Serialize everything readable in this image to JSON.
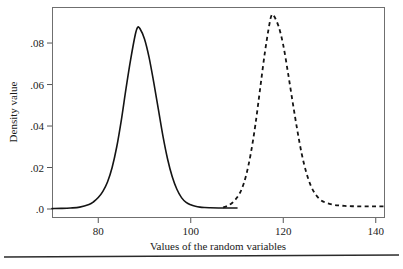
{
  "chart_data": {
    "type": "line",
    "title": "",
    "xlabel": "Values of the random variables",
    "ylabel": "Density value",
    "xlim": [
      70,
      142
    ],
    "ylim": [
      0,
      0.094
    ],
    "grid": false,
    "legend": "none",
    "xticks": [
      80,
      100,
      120,
      140
    ],
    "xtick_labels": [
      "80",
      "100",
      "120",
      "140"
    ],
    "yticks": [
      0,
      0.02,
      0.04,
      0.06,
      0.08
    ],
    "ytick_labels": [
      ".0",
      ".02",
      ".04",
      ".06",
      ".08"
    ],
    "series": [
      {
        "name": "distribution-1",
        "style": "solid",
        "mean": 88.5,
        "sd": 4.6,
        "peak_value": 0.0875,
        "x": [
          70,
          72,
          74,
          76,
          78,
          79,
          80,
          81,
          82,
          83,
          84,
          85,
          86,
          87,
          88,
          88.5,
          89,
          90,
          91,
          92,
          93,
          94,
          95,
          96,
          97,
          98,
          99,
          100,
          101,
          102,
          103,
          104,
          106,
          108,
          110
        ],
        "y": [
          0.0002,
          0.0003,
          0.0005,
          0.0009,
          0.0022,
          0.0035,
          0.0055,
          0.0085,
          0.013,
          0.02,
          0.03,
          0.043,
          0.058,
          0.072,
          0.084,
          0.0875,
          0.087,
          0.082,
          0.073,
          0.061,
          0.048,
          0.035,
          0.024,
          0.0155,
          0.0095,
          0.0055,
          0.0032,
          0.002,
          0.0013,
          0.0009,
          0.0007,
          0.0006,
          0.0005,
          0.0005,
          0.0005
        ]
      },
      {
        "name": "distribution-2",
        "style": "dashed",
        "mean": 117.5,
        "sd": 4.6,
        "peak_value": 0.0935,
        "x": [
          107,
          108,
          109,
          110,
          111,
          112,
          113,
          114,
          115,
          116,
          117,
          117.5,
          118,
          119,
          120,
          121,
          122,
          123,
          124,
          125,
          126,
          127,
          128,
          129,
          130,
          131,
          132,
          134,
          136,
          138,
          140,
          142
        ],
        "y": [
          0.0008,
          0.0016,
          0.003,
          0.0055,
          0.0095,
          0.0165,
          0.027,
          0.041,
          0.058,
          0.075,
          0.089,
          0.0935,
          0.093,
          0.088,
          0.079,
          0.066,
          0.052,
          0.0385,
          0.0265,
          0.0175,
          0.011,
          0.007,
          0.0045,
          0.0032,
          0.0025,
          0.002,
          0.0017,
          0.0014,
          0.0013,
          0.0013,
          0.0013,
          0.0013
        ]
      }
    ]
  },
  "figure": {
    "plot_left": 52,
    "plot_right": 385,
    "plot_top": 7,
    "plot_bottom": 218,
    "frame_color": "#6f6f6f",
    "curve_color": "#141414",
    "background": "#ffffff",
    "footer_rule": true
  }
}
